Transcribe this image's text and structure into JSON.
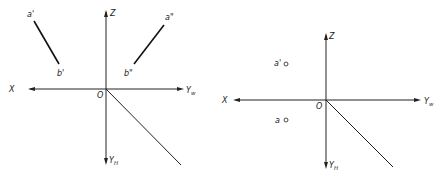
{
  "left_diagram": {
    "axes": {
      "x": "X",
      "z": "Z",
      "yw": "Y",
      "yw_sub": "w",
      "yh": "Y",
      "yh_sub": "H",
      "origin": "O"
    },
    "segment_front": {
      "start": "a'",
      "end": "b'"
    },
    "segment_side": {
      "start": "a\"",
      "end": "b\""
    }
  },
  "right_diagram": {
    "axes": {
      "x": "X",
      "z": "Z",
      "yw": "Y",
      "yw_sub": "w",
      "yh": "Y",
      "yh_sub": "H",
      "origin": "O"
    },
    "points": [
      {
        "label": "a'"
      },
      {
        "label": "a"
      }
    ]
  }
}
